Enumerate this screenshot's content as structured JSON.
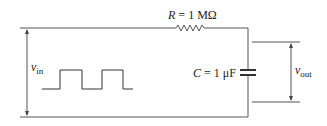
{
  "diagram": {
    "type": "RC low-pass circuit",
    "resistor": {
      "symbol": "R",
      "equals": " = ",
      "value": "1 MΩ"
    },
    "capacitor": {
      "symbol": "C",
      "equals": " = ",
      "value": "1 μF"
    },
    "input": {
      "symbol": "v",
      "subscript": "in",
      "waveform": "square-wave"
    },
    "output": {
      "symbol": "v",
      "subscript": "out"
    },
    "colors": {
      "line": "#555555",
      "text": "#222222",
      "background": "#ffffff"
    }
  }
}
